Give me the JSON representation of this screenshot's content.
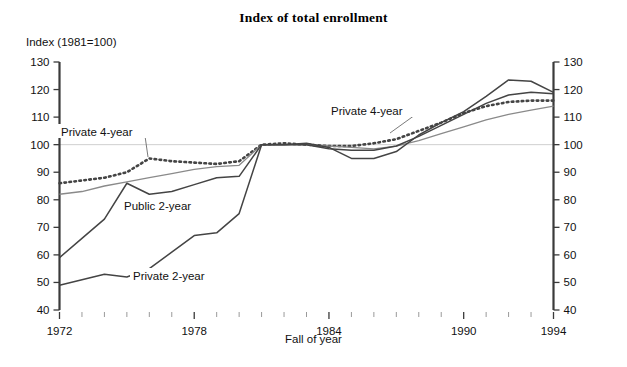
{
  "chart_data": {
    "type": "line",
    "title": "Index of total enrollment",
    "ylabel": "Index (1981=100)",
    "xlabel": "Fall of year",
    "ylim": [
      40,
      130
    ],
    "xlim": [
      1972,
      1994
    ],
    "ytick_labels": [
      "40",
      "50",
      "60",
      "70",
      "80",
      "90",
      "100",
      "110",
      "120",
      "130"
    ],
    "ytick_values": [
      40,
      50,
      60,
      70,
      80,
      90,
      100,
      110,
      120,
      130
    ],
    "xtick_labels": [
      "1972",
      "1978",
      "1984",
      "1990",
      "1994"
    ],
    "xtick_values": [
      1972,
      1978,
      1984,
      1990,
      1994
    ],
    "grid": "reference line at 100 only",
    "legend_position": "inline annotations",
    "x": [
      1972,
      1973,
      1974,
      1975,
      1976,
      1977,
      1978,
      1979,
      1980,
      1981,
      1982,
      1983,
      1984,
      1985,
      1986,
      1987,
      1988,
      1989,
      1990,
      1991,
      1992,
      1993,
      1994
    ],
    "series": [
      {
        "name": "Private 4-year",
        "style": "dotted",
        "values": [
          86,
          87,
          88,
          90,
          95,
          94,
          93.5,
          93,
          94,
          100,
          100.5,
          100,
          99.5,
          99.5,
          100.5,
          102,
          105,
          108,
          111.5,
          114,
          115.5,
          116,
          116
        ]
      },
      {
        "name": "Public 4-year",
        "style": "thin-gray",
        "values": [
          82,
          83,
          85,
          86.5,
          88,
          89.5,
          91,
          92,
          92.5,
          100,
          100,
          100,
          99.5,
          99,
          98.5,
          99.5,
          101.5,
          104,
          106.5,
          109,
          111,
          112.5,
          114
        ]
      },
      {
        "name": "Public 2-year",
        "style": "solid",
        "values": [
          59,
          66,
          73,
          86,
          82,
          83,
          85.5,
          88,
          88.5,
          100,
          100,
          100.5,
          99,
          95,
          95,
          97.5,
          103.5,
          108,
          112,
          117.5,
          123.5,
          123,
          119
        ]
      },
      {
        "name": "Private 2-year",
        "style": "solid",
        "values": [
          49,
          51,
          53,
          52,
          55,
          61,
          67,
          68,
          75,
          100,
          100,
          100,
          98.5,
          98,
          98,
          99.5,
          103,
          107,
          111,
          115,
          118,
          119,
          118.5
        ]
      }
    ],
    "annotations": [
      {
        "text": "Private 4-year",
        "x": 61,
        "y": 133,
        "target_x": 148,
        "target_y": 157
      },
      {
        "text": "Public 2-year",
        "x": 124,
        "y": 207
      },
      {
        "text": "Private 2-year",
        "x": 133,
        "y": 277
      },
      {
        "text": "Private 4-year",
        "x": 331,
        "y": 112,
        "target_x": 390,
        "target_y": 133
      }
    ]
  },
  "colors": {
    "axis": "#3a3a3a",
    "series_dark": "#444444",
    "series_gray": "#8a8a8a",
    "reference_line": "#cfcfcf",
    "background": "#ffffff"
  }
}
